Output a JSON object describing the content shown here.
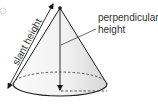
{
  "diagram": {
    "labels": {
      "slant_height": "slant height",
      "perpendicular_height_line1": "perpendicular",
      "perpendicular_height_line2": "height"
    },
    "colors": {
      "stroke": "#1a1a1a",
      "fill_light": "#f7f7f7",
      "fill_shade": "#d9d9d9",
      "text": "#333333"
    }
  }
}
